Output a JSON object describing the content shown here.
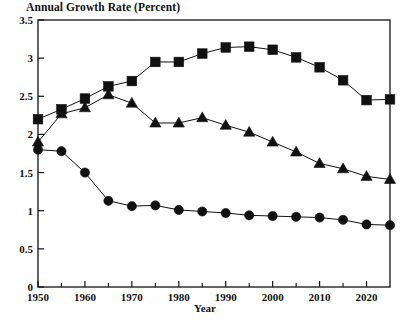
{
  "chart_data": {
    "type": "line",
    "title": "Annual Growth Rate (Percent)",
    "xlabel": "Year",
    "ylabel": "",
    "xlim": [
      1950,
      2025
    ],
    "ylim": [
      0,
      3.5
    ],
    "grid": false,
    "legend_position": "none",
    "x_tick_labels": [
      "1950",
      "1960",
      "1970",
      "1980",
      "1990",
      "2000",
      "2010",
      "2020"
    ],
    "x_tick_values": [
      1950,
      1960,
      1970,
      1980,
      1990,
      2000,
      2010,
      2020
    ],
    "x_minor_tick_values": [
      1955,
      1965,
      1975,
      1985,
      1995,
      2005,
      2015,
      2025
    ],
    "y_tick_labels": [
      "0",
      "0.5",
      "1",
      "1.5",
      "2",
      "2.5",
      "3",
      "3.5"
    ],
    "y_tick_values": [
      0,
      0.5,
      1,
      1.5,
      2,
      2.5,
      3,
      3.5
    ],
    "x": [
      1950,
      1955,
      1960,
      1965,
      1970,
      1975,
      1980,
      1985,
      1990,
      1995,
      2000,
      2005,
      2010,
      2015,
      2020,
      2025
    ],
    "series": [
      {
        "name": "square-series",
        "marker": "square",
        "color": "#111111",
        "values": [
          2.2,
          2.33,
          2.47,
          2.63,
          2.7,
          2.95,
          2.95,
          3.06,
          3.14,
          3.15,
          3.11,
          3.01,
          2.88,
          2.71,
          2.45,
          2.46
        ]
      },
      {
        "name": "triangle-series",
        "marker": "triangle",
        "color": "#111111",
        "values": [
          1.9,
          2.27,
          2.35,
          2.52,
          2.41,
          2.15,
          2.15,
          2.22,
          2.12,
          2.03,
          1.9,
          1.77,
          1.62,
          1.55,
          1.45,
          1.41
        ]
      },
      {
        "name": "circle-series",
        "marker": "circle",
        "color": "#111111",
        "values": [
          1.8,
          1.78,
          1.5,
          1.13,
          1.06,
          1.07,
          1.01,
          0.99,
          0.97,
          0.94,
          0.93,
          0.92,
          0.91,
          0.88,
          0.82,
          0.81
        ]
      }
    ]
  },
  "plot_geometry": {
    "left": 38,
    "right": 390,
    "top": 20,
    "bottom": 287
  }
}
